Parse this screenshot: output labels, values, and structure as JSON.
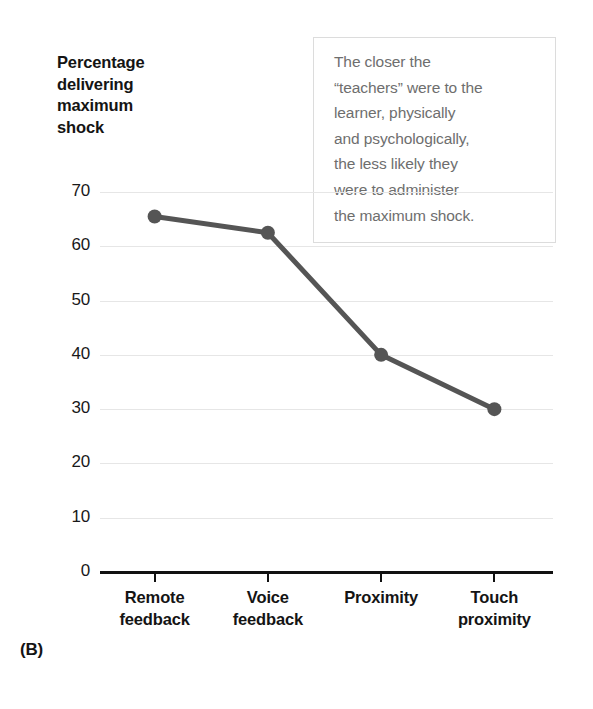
{
  "panel_label": "(B)",
  "annotation": {
    "text": "The closer the\n“teachers” were to the\nlearner, physically\nand psychologically,\nthe less likely they\nwere to administer\nthe maximum shock.",
    "border_color": "#dcdcdc",
    "text_color": "#6e6e6e"
  },
  "chart_data": {
    "type": "line",
    "title": "",
    "subtitle": "",
    "xlabel": "",
    "ylabel": "Percentage\ndelivering\nmaximum\nshock",
    "categories": [
      "Remote\nfeedback",
      "Voice\nfeedback",
      "Proximity",
      "Touch\nproximity"
    ],
    "values": [
      65.5,
      62.5,
      40,
      30
    ],
    "series": [
      {
        "name": "Percentage delivering maximum shock",
        "values": [
          65.5,
          62.5,
          40,
          30
        ]
      }
    ],
    "ylim": [
      0,
      70
    ],
    "yticks": [
      0,
      10,
      20,
      30,
      40,
      50,
      60,
      70
    ],
    "ytick_labels": [
      "0",
      "10",
      "20",
      "30",
      "40",
      "50",
      "60",
      "70"
    ],
    "grid": true,
    "grid_axis": "y",
    "legend": "none",
    "line_color": "#555555",
    "marker": "circle",
    "marker_color": "#555555",
    "annotations": [
      "The closer the “teachers” were to the learner, physically and psychologically, the less likely they were to administer the maximum shock."
    ]
  }
}
